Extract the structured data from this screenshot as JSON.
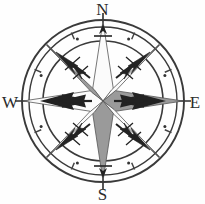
{
  "figure": {
    "kind": "compass-rose",
    "width": 205,
    "height": 204,
    "background_color": "#fefefe"
  },
  "colors": {
    "background": "#fefefe",
    "ink": "#2b2b2b",
    "ray_gray": "#9a9a9a",
    "ray_white": "#fbfbfb",
    "ring_line": "#3a3a3a",
    "needle_dark": "#222222",
    "tick": "#444444"
  },
  "geometry": {
    "center_x": 103,
    "center_y": 101,
    "outer_ring_radius": 81,
    "mid_ring_radius": 74,
    "dot_ring_radius": 67,
    "inner_ring_radius": 60,
    "star_long_radius": 80,
    "star_short_radius": 57,
    "axis_tip_radius": 88
  },
  "cardinals": [
    {
      "id": "north",
      "label": "N",
      "bearing_degrees": 0
    },
    {
      "id": "east",
      "label": "E",
      "bearing_degrees": 90
    },
    {
      "id": "south",
      "label": "S",
      "bearing_degrees": 180
    },
    {
      "id": "west",
      "label": "W",
      "bearing_degrees": 270
    }
  ],
  "star": {
    "point_count": 8,
    "points": [
      {
        "id": "n",
        "bearing_degrees": 0,
        "fill": "white"
      },
      {
        "id": "ne",
        "bearing_degrees": 45,
        "fill": "white"
      },
      {
        "id": "e",
        "bearing_degrees": 90,
        "fill": "gray"
      },
      {
        "id": "se",
        "bearing_degrees": 135,
        "fill": "white"
      },
      {
        "id": "s",
        "bearing_degrees": 180,
        "fill": "gray"
      },
      {
        "id": "sw",
        "bearing_degrees": 225,
        "fill": "white"
      },
      {
        "id": "w",
        "bearing_degrees": 270,
        "fill": "white"
      },
      {
        "id": "nw",
        "bearing_degrees": 315,
        "fill": "gray"
      }
    ]
  },
  "needles": [
    {
      "id": "needle-north",
      "bearing_degrees": 0
    },
    {
      "id": "needle-northeast",
      "bearing_degrees": 45
    },
    {
      "id": "needle-east",
      "bearing_degrees": 90
    },
    {
      "id": "needle-southeast",
      "bearing_degrees": 135
    },
    {
      "id": "needle-south",
      "bearing_degrees": 180
    },
    {
      "id": "needle-southwest",
      "bearing_degrees": 225
    },
    {
      "id": "needle-west",
      "bearing_degrees": 270
    },
    {
      "id": "needle-northwest",
      "bearing_degrees": 315
    }
  ],
  "ring": {
    "dot_count": 8,
    "dot_bearings": [
      22.5,
      67.5,
      112.5,
      157.5,
      202.5,
      247.5,
      292.5,
      337.5
    ],
    "tick_count": 8,
    "tick_bearings": [
      22.5,
      67.5,
      112.5,
      157.5,
      202.5,
      247.5,
      292.5,
      337.5
    ]
  }
}
